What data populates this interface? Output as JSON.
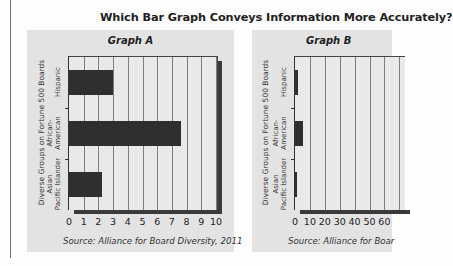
{
  "page": {
    "title": "Which Bar Graph Conveys Information More Accurately?"
  },
  "graphs": [
    {
      "title": "Graph A",
      "y_axis_title": "Diverse Groups on Fortune 500 Boards",
      "categories": [
        "Hispanic",
        "African-American",
        "Asian Pacific Islander"
      ],
      "category_lines": [
        [
          "Hispanic"
        ],
        [
          "African-",
          "American"
        ],
        [
          "Asian",
          "Pacific Islander"
        ]
      ],
      "x_ticks": [
        "0",
        "1",
        "2",
        "3",
        "4",
        "5",
        "6",
        "7",
        "8",
        "9",
        "10"
      ],
      "source": "Source: Alliance for Board Diversity, 2011"
    },
    {
      "title": "Graph B",
      "y_axis_title": "Diverse Groups on Fortune 500 Boards",
      "categories": [
        "Hispanic",
        "African-American",
        "Asian Pacific Islander"
      ],
      "category_lines": [
        [
          "Hispanic"
        ],
        [
          "African-",
          "American"
        ],
        [
          "Asian",
          "Pacific Islander"
        ]
      ],
      "x_ticks": [
        "0",
        "10",
        "20",
        "30",
        "40",
        "50",
        "60"
      ],
      "source": "Source: Alliance for Boar"
    }
  ],
  "chart_data": [
    {
      "type": "bar",
      "orientation": "horizontal",
      "title": "Graph A",
      "categories": [
        "Hispanic",
        "African-American",
        "Asian Pacific Islander"
      ],
      "values": [
        3.0,
        7.6,
        2.2
      ],
      "xlabel": "",
      "ylabel": "Diverse Groups on Fortune 500 Boards",
      "xlim": [
        0,
        10
      ],
      "x_ticks": [
        0,
        1,
        2,
        3,
        4,
        5,
        6,
        7,
        8,
        9,
        10
      ],
      "grid": true,
      "source": "Source: Alliance for Board Diversity, 2011"
    },
    {
      "type": "bar",
      "orientation": "horizontal",
      "title": "Graph B",
      "categories": [
        "Hispanic",
        "African-American",
        "Asian Pacific Islander"
      ],
      "values": [
        3.0,
        7.6,
        2.2
      ],
      "xlabel": "",
      "ylabel": "Diverse Groups on Fortune 500 Boards",
      "xlim": [
        0,
        100
      ],
      "x_ticks_visible": [
        0,
        10,
        20,
        30,
        40,
        50,
        60
      ],
      "grid": true,
      "source": "Source: Alliance for Board Diversity, 2011"
    }
  ],
  "colors": {
    "panel_bg": "#e3e3e3",
    "plot_bg": "#e9e9e9",
    "bar": "#2f2f2f",
    "gridline": "#7d7d7d"
  }
}
